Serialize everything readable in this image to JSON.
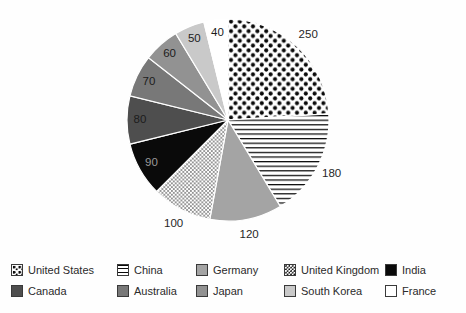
{
  "figure": {
    "background": "#fefefe"
  },
  "chart_data": {
    "type": "pie",
    "total": 1040,
    "start_angle_deg": 0,
    "direction": "clockwise",
    "slices": [
      {
        "label": "United States",
        "value": 250,
        "fill": "dots-large",
        "color": "#0a0a0a",
        "bg": "#ffffff",
        "value_label_position": "outside",
        "value_label_color": "#262626"
      },
      {
        "label": "China",
        "value": 180,
        "fill": "hlines",
        "color": "#0a0a0a",
        "bg": "#ffffff",
        "value_label_position": "outside",
        "value_label_color": "#262626"
      },
      {
        "label": "Germany",
        "value": 120,
        "fill": "solid",
        "color": "#a4a4a4",
        "value_label_position": "outside",
        "value_label_color": "#262626"
      },
      {
        "label": "United Kingdom",
        "value": 100,
        "fill": "dots-fine",
        "color": "#0a0a0a",
        "bg": "#ffffff",
        "value_label_position": "outside",
        "value_label_color": "#262626"
      },
      {
        "label": "India",
        "value": 90,
        "fill": "solid",
        "color": "#0a0a0a",
        "value_label_position": "inside",
        "value_label_color": "#999999"
      },
      {
        "label": "Canada",
        "value": 80,
        "fill": "solid",
        "color": "#4e4e4e",
        "value_label_position": "inside",
        "value_label_color": "#1c1c1c"
      },
      {
        "label": "Australia",
        "value": 70,
        "fill": "solid",
        "color": "#787878",
        "value_label_position": "inside",
        "value_label_color": "#1c1c1c"
      },
      {
        "label": "Japan",
        "value": 60,
        "fill": "solid",
        "color": "#929292",
        "value_label_position": "inside",
        "value_label_color": "#1c1c1c"
      },
      {
        "label": "South Korea",
        "value": 50,
        "fill": "solid",
        "color": "#c9c9c9",
        "value_label_position": "inside",
        "value_label_color": "#1c1c1c"
      },
      {
        "label": "France",
        "value": 40,
        "fill": "solid",
        "color": "#ffffff",
        "value_label_position": "inside",
        "value_label_color": "#1c1c1c"
      }
    ],
    "legend": {
      "position": "bottom",
      "rows": 2,
      "order": "row-major",
      "entries": [
        "United States",
        "China",
        "Germany",
        "United Kingdom",
        "India",
        "Canada",
        "Australia",
        "Japan",
        "South Korea",
        "France"
      ]
    },
    "layout": {
      "center_x": 228,
      "center_y": 120,
      "radius": 101,
      "label_radius_inside": 88,
      "label_radius_outside": 117,
      "slice_stroke": "#ffffff",
      "slice_stroke_width": 1.2
    }
  }
}
